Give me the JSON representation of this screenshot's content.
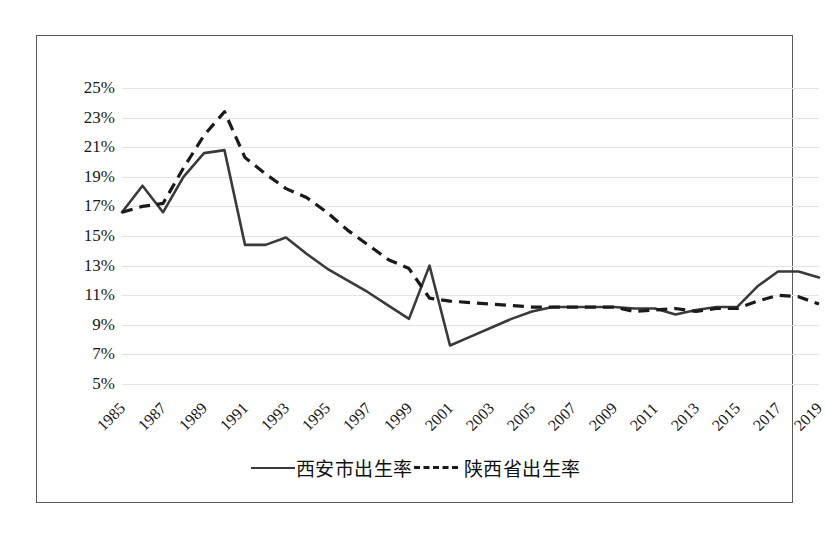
{
  "chart_data": {
    "type": "line",
    "title": "",
    "xlabel": "",
    "ylabel": "",
    "ylim": [
      5,
      25
    ],
    "ytick_step": 2,
    "ytick_labels": [
      "25%",
      "23%",
      "21%",
      "19%",
      "17%",
      "15%",
      "13%",
      "11%",
      "9%",
      "7%",
      "5%"
    ],
    "ytick_values": [
      25,
      23,
      21,
      19,
      17,
      15,
      13,
      11,
      9,
      7,
      5
    ],
    "grid": true,
    "grid_color": "#e3e3e3",
    "legend_position": "bottom",
    "x": [
      1985,
      1986,
      1987,
      1988,
      1989,
      1990,
      1991,
      1992,
      1993,
      1994,
      1995,
      1996,
      1997,
      1998,
      1999,
      2000,
      2001,
      2002,
      2003,
      2004,
      2005,
      2006,
      2007,
      2008,
      2009,
      2010,
      2011,
      2012,
      2013,
      2014,
      2015,
      2016,
      2017,
      2018,
      2019
    ],
    "xtick_labels": [
      "1985",
      "1987",
      "1989",
      "1991",
      "1993",
      "1995",
      "1997",
      "1999",
      "2001",
      "2003",
      "2005",
      "2007",
      "2009",
      "2011",
      "2013",
      "2015",
      "2017",
      "2019"
    ],
    "xtick_values": [
      1985,
      1987,
      1989,
      1991,
      1993,
      1995,
      1997,
      1999,
      2001,
      2003,
      2005,
      2007,
      2009,
      2011,
      2013,
      2015,
      2017,
      2019
    ],
    "series": [
      {
        "name": "西安市出生率",
        "style": "solid",
        "color": "#3a3a3a",
        "values": [
          16.6,
          18.4,
          16.6,
          19.0,
          20.6,
          20.8,
          14.4,
          14.4,
          14.9,
          13.8,
          12.8,
          12.0,
          11.2,
          10.3,
          9.4,
          13.0,
          7.6,
          8.2,
          8.8,
          9.4,
          9.9,
          10.2,
          10.2,
          10.2,
          10.2,
          10.1,
          10.1,
          9.7,
          10.0,
          10.2,
          10.2,
          11.6,
          12.6,
          12.6,
          12.2
        ]
      },
      {
        "name": "陕西省出生率",
        "style": "dashed",
        "color": "#1a1a1a",
        "values": [
          16.6,
          17.0,
          17.2,
          19.6,
          21.8,
          23.4,
          20.3,
          19.2,
          18.2,
          17.6,
          16.6,
          15.4,
          14.4,
          13.4,
          12.8,
          10.8,
          10.6,
          10.5,
          10.4,
          10.3,
          10.2,
          10.2,
          10.2,
          10.2,
          10.2,
          9.9,
          10.0,
          10.1,
          9.9,
          10.1,
          10.1,
          10.6,
          11.0,
          10.9,
          10.4
        ]
      }
    ]
  },
  "legend": {
    "items": [
      {
        "label": "西安市出生率",
        "style": "solid"
      },
      {
        "label": "陕西省出生率",
        "style": "dashed"
      }
    ]
  }
}
